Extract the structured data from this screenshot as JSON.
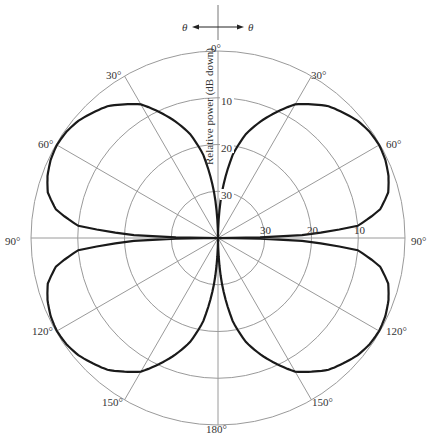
{
  "chart_data": {
    "type": "polar",
    "title": "",
    "radial_axis_label": "Relative power (dB down)",
    "radial_ticks": [
      "10",
      "20",
      "30"
    ],
    "radial_range_db": [
      0,
      40
    ],
    "angle_ticks": [
      "0°",
      "30°",
      "60°",
      "90°",
      "120°",
      "150°",
      "180°",
      "150°",
      "120°",
      "90°",
      "60°",
      "30°"
    ],
    "angle_convention": {
      "left": "θ",
      "right": "θ"
    },
    "series": [
      {
        "name": "Radiation pattern",
        "symmetry": "four-fold (mirror about 0°–180° and 90°–90° axes)",
        "angles_deg": [
          0,
          5,
          10,
          15,
          20,
          30,
          40,
          50,
          55,
          60,
          65,
          70,
          75,
          80,
          85,
          88,
          90
        ],
        "db_down": [
          40,
          30,
          22,
          17,
          13.5,
          7,
          3.2,
          1.0,
          0.4,
          0.2,
          0.5,
          1.2,
          2.3,
          4.8,
          10,
          22,
          40
        ]
      }
    ]
  },
  "labels": {
    "theta_left": "θ",
    "theta_right": "θ",
    "a0": "0°",
    "a30r": "30°",
    "a60r": "60°",
    "a90r": "90°",
    "a120r": "120°",
    "a150r": "150°",
    "a180": "180°",
    "a150l": "150°",
    "a120l": "120°",
    "a90l": "90°",
    "a60l": "60°",
    "a30l": "30°",
    "ring10v": "10",
    "ring20v": "20",
    "ring30v": "30",
    "ring10h": "10",
    "ring20h": "20",
    "ring30h": "30",
    "axis_label": "Relative power (dB down)"
  },
  "colors": {
    "grid": "#9a9a9a",
    "curve": "#1a1a1a",
    "text": "#333333"
  }
}
